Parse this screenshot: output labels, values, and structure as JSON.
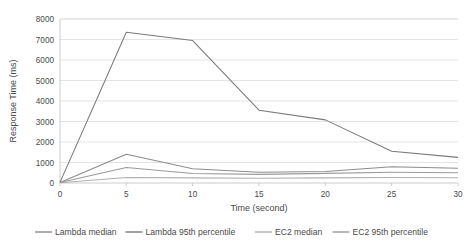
{
  "chart_data": {
    "type": "line",
    "title": "",
    "xlabel": "Time (second)",
    "ylabel": "Response Time (ms)",
    "x": [
      0,
      5,
      10,
      15,
      20,
      25,
      30
    ],
    "xtick_labels": [
      "0",
      "5",
      "10",
      "15",
      "20",
      "25",
      "30"
    ],
    "ytick_labels": [
      "0",
      "1000",
      "2000",
      "3000",
      "4000",
      "5000",
      "6000",
      "7000",
      "8000"
    ],
    "yticks": [
      0,
      1000,
      2000,
      3000,
      4000,
      5000,
      6000,
      7000,
      8000
    ],
    "xlim": [
      0,
      30
    ],
    "ylim": [
      0,
      8000
    ],
    "grid": "horizontal",
    "legend_position": "bottom",
    "series": [
      {
        "name": "Lambda median",
        "color": "#8c8c8c",
        "values": [
          20,
          1400,
          700,
          520,
          560,
          790,
          720
        ]
      },
      {
        "name": "Lambda 95th percentile",
        "color": "#7a7a7a",
        "values": [
          30,
          7350,
          6950,
          3550,
          3080,
          1550,
          1250
        ]
      },
      {
        "name": "EC2 median",
        "color": "#b0b0b0",
        "values": [
          15,
          270,
          250,
          230,
          250,
          270,
          255
        ]
      },
      {
        "name": "EC2 95th percentile",
        "color": "#9a9a9a",
        "values": [
          25,
          760,
          460,
          420,
          470,
          520,
          500
        ]
      }
    ]
  },
  "legend": {
    "items": [
      {
        "label": "Lambda median"
      },
      {
        "label": "Lambda 95th percentile"
      },
      {
        "label": "EC2 median"
      },
      {
        "label": "EC2 95th percentile"
      }
    ]
  }
}
